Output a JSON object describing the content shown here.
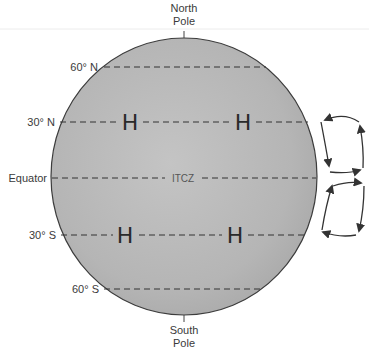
{
  "diagram": {
    "poles": {
      "north": [
        "North",
        "Pole"
      ],
      "south": [
        "South",
        "Pole"
      ]
    },
    "latitudes": [
      {
        "label": "60° N",
        "y": 67
      },
      {
        "label": "30° N",
        "y": 122
      },
      {
        "label": "Equator",
        "y": 178
      },
      {
        "label": "30° S",
        "y": 235
      },
      {
        "label": "60° S",
        "y": 289
      }
    ],
    "zone_label": "ITCZ",
    "highs": [
      {
        "label": "H",
        "lat": "30° N",
        "x": 130,
        "y": 122
      },
      {
        "label": "H",
        "lat": "30° N",
        "x": 243,
        "y": 122
      },
      {
        "label": "H",
        "lat": "30° S",
        "x": 125,
        "y": 235
      },
      {
        "label": "H",
        "lat": "30° S",
        "x": 235,
        "y": 235
      }
    ],
    "circulation_cells": [
      {
        "name": "northern Hadley cell",
        "direction": "clockwise loop between 30° N and Equator"
      },
      {
        "name": "southern Hadley cell",
        "direction": "loop between Equator and 30° S"
      }
    ],
    "colors": {
      "globe_fill": "#b8b8b8",
      "globe_edge": "#3c3c3c",
      "dash": "#333333",
      "text": "#3a3a3a"
    }
  }
}
